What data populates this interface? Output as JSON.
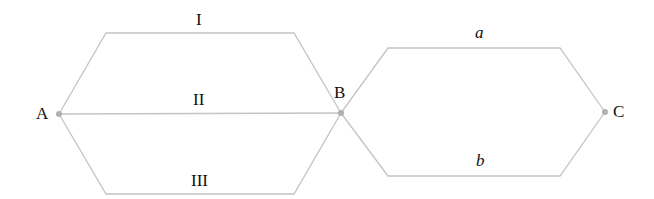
{
  "diagram": {
    "type": "path-network",
    "colors": {
      "line": "#c4c4c4",
      "node": "#b0b0b0",
      "text": "#111111"
    },
    "nodes": [
      {
        "id": "A",
        "label": "A",
        "x": 59,
        "y": 114
      },
      {
        "id": "B",
        "label": "B",
        "x": 341,
        "y": 113
      },
      {
        "id": "C",
        "label": "C",
        "x": 605,
        "y": 112
      }
    ],
    "paths": [
      {
        "id": "I",
        "label": "I",
        "from": "A",
        "to": "B"
      },
      {
        "id": "II",
        "label": "II",
        "from": "A",
        "to": "B"
      },
      {
        "id": "III",
        "label": "III",
        "from": "A",
        "to": "B"
      },
      {
        "id": "a",
        "label": "a",
        "from": "B",
        "to": "C"
      },
      {
        "id": "b",
        "label": "b",
        "from": "B",
        "to": "C"
      }
    ]
  }
}
